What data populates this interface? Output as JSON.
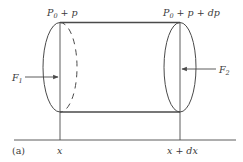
{
  "figure": {
    "panel_label": "(a)",
    "pressure_left": {
      "base": "P",
      "sub": "0",
      "rest": " + p"
    },
    "pressure_right": {
      "base": "P",
      "sub": "0",
      "rest": " + p + dp"
    },
    "force_left": {
      "base": "F",
      "sub": "1"
    },
    "force_right": {
      "base": "F",
      "sub": "2"
    },
    "position_left": "x",
    "position_right": "x + dx"
  },
  "colors": {
    "stroke": "#4a4a4a",
    "text": "#3a3a3a",
    "background": "#ffffff"
  }
}
